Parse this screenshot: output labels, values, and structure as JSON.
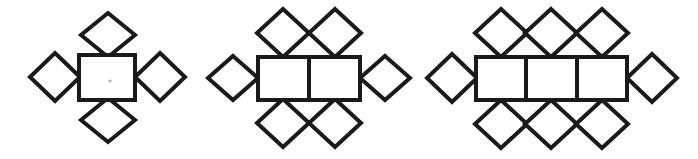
{
  "page": {
    "background_color": "#ffffff",
    "stroke_color": "#1a1a1a",
    "fill_color": "#ffffff",
    "stroke_width": 4,
    "width": 698,
    "height": 159
  },
  "figures": [
    {
      "id": "figure-1",
      "name": "pattern-term-1",
      "label": "",
      "square_count": 1,
      "diamond_count": 4,
      "diamonds_top": 1,
      "diamonds_bottom": 1,
      "diamonds_left": 1,
      "diamonds_right": 1,
      "rect": {
        "x": 79,
        "y": 55,
        "width": 56,
        "height": 45
      },
      "cell_width": 56,
      "dividers": [],
      "diamonds": [
        {
          "name": "diamond-top-1",
          "cx": 108,
          "cy": 35,
          "rx": 27,
          "ry": 22
        },
        {
          "name": "diamond-bottom-1",
          "cx": 108,
          "cy": 120,
          "rx": 27,
          "ry": 22
        },
        {
          "name": "diamond-left-1",
          "cx": 55,
          "cy": 77,
          "rx": 25,
          "ry": 24
        },
        {
          "name": "diamond-right-1",
          "cx": 160,
          "cy": 77,
          "rx": 25,
          "ry": 24
        }
      ],
      "speck": {
        "cx": 110,
        "cy": 81,
        "r": 1.6
      }
    },
    {
      "id": "figure-2",
      "name": "pattern-term-2",
      "label": "",
      "square_count": 2,
      "diamond_count": 6,
      "diamonds_top": 2,
      "diamonds_bottom": 2,
      "diamonds_left": 1,
      "diamonds_right": 1,
      "rect": {
        "x": 258,
        "y": 57,
        "width": 102,
        "height": 43
      },
      "cell_width": 51,
      "dividers": [
        309
      ],
      "diamonds": [
        {
          "name": "diamond-top-1",
          "cx": 283,
          "cy": 33,
          "rx": 26,
          "ry": 24
        },
        {
          "name": "diamond-top-2",
          "cx": 335,
          "cy": 33,
          "rx": 26,
          "ry": 24
        },
        {
          "name": "diamond-bottom-1",
          "cx": 283,
          "cy": 123,
          "rx": 26,
          "ry": 24
        },
        {
          "name": "diamond-bottom-2",
          "cx": 335,
          "cy": 123,
          "rx": 26,
          "ry": 24
        },
        {
          "name": "diamond-left-1",
          "cx": 233,
          "cy": 78,
          "rx": 25,
          "ry": 22
        },
        {
          "name": "diamond-right-1",
          "cx": 385,
          "cy": 78,
          "rx": 25,
          "ry": 22
        }
      ],
      "speck": null
    },
    {
      "id": "figure-3",
      "name": "pattern-term-3",
      "label": "",
      "square_count": 3,
      "diamond_count": 8,
      "diamonds_top": 3,
      "diamonds_bottom": 3,
      "diamonds_left": 1,
      "diamonds_right": 1,
      "rect": {
        "x": 476,
        "y": 57,
        "width": 151,
        "height": 43
      },
      "cell_width": 50,
      "dividers": [
        526,
        577
      ],
      "diamonds": [
        {
          "name": "diamond-top-1",
          "cx": 501,
          "cy": 33,
          "rx": 26,
          "ry": 24
        },
        {
          "name": "diamond-top-2",
          "cx": 551,
          "cy": 33,
          "rx": 26,
          "ry": 24
        },
        {
          "name": "diamond-top-3",
          "cx": 602,
          "cy": 33,
          "rx": 26,
          "ry": 24
        },
        {
          "name": "diamond-bottom-1",
          "cx": 501,
          "cy": 124,
          "rx": 26,
          "ry": 24
        },
        {
          "name": "diamond-bottom-2",
          "cx": 551,
          "cy": 124,
          "rx": 26,
          "ry": 24
        },
        {
          "name": "diamond-bottom-3",
          "cx": 602,
          "cy": 124,
          "rx": 26,
          "ry": 24
        },
        {
          "name": "diamond-left-1",
          "cx": 452,
          "cy": 78,
          "rx": 25,
          "ry": 24
        },
        {
          "name": "diamond-right-1",
          "cx": 652,
          "cy": 78,
          "rx": 25,
          "ry": 24
        }
      ],
      "speck": null
    }
  ]
}
